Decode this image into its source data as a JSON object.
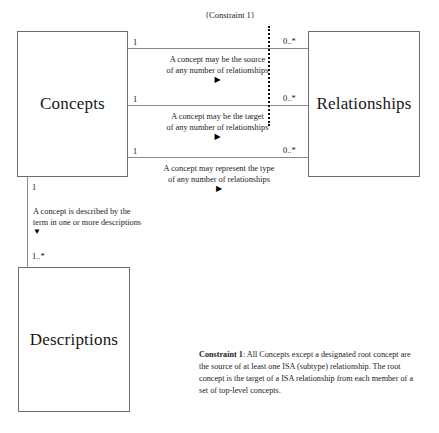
{
  "diagram": {
    "classes": [
      {
        "id": "concepts",
        "name": "Concepts"
      },
      {
        "id": "relationships",
        "name": "Relationships"
      },
      {
        "id": "descriptions",
        "name": "Descriptions"
      }
    ],
    "associations": [
      {
        "id": "assoc1",
        "from": "Concepts",
        "to": "Relationships",
        "source_multiplicity": "1",
        "target_multiplicity": "0..*",
        "label_line1": "A concept may be the source",
        "label_line2": "of any number of relationships",
        "direction_arrow": "▶"
      },
      {
        "id": "assoc2",
        "from": "Concepts",
        "to": "Relationships",
        "source_multiplicity": "1",
        "target_multiplicity": "0..*",
        "label_line1": "A concept may be the target",
        "label_line2": "of any number of relationships",
        "direction_arrow": "▶"
      },
      {
        "id": "assoc3",
        "from": "Concepts",
        "to": "Relationships",
        "source_multiplicity": "1",
        "target_multiplicity": "0..*",
        "label_line1": "A concept may represent the type",
        "label_line2": "of any number of relationships",
        "direction_arrow": "▶"
      },
      {
        "id": "assoc4",
        "from": "Concepts",
        "to": "Descriptions",
        "source_multiplicity": "1",
        "target_multiplicity": "1..*",
        "label_line1": "A concept is described by the",
        "label_line2": "term in one or more descriptions",
        "direction_arrow": "▼"
      }
    ],
    "constraint_marker": {
      "label": "{Constraint 1}"
    },
    "constraint_note": {
      "title": "Constraint 1",
      "body": ": All Concepts except a designated root concept are the source of at least one ISA (subtype) relationship. The root concept is the target of a ISA relationship from each member of a set of top-level concepts."
    }
  }
}
